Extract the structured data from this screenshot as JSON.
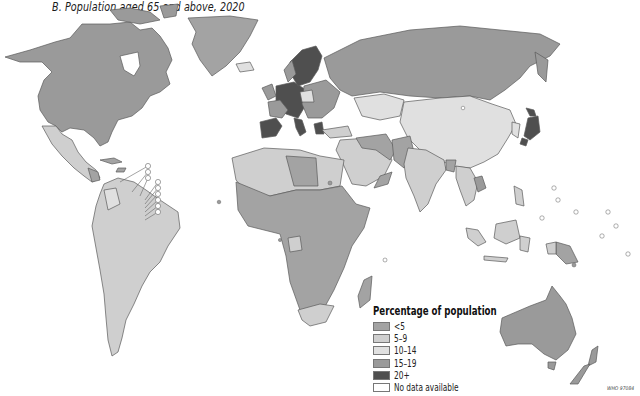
{
  "title": "B.  Population aged 65 and above, 2020",
  "legend": {
    "title": "Percentage of population",
    "items": [
      {
        "label": "<5",
        "color": "#a3a3a3"
      },
      {
        "label": "5–9",
        "color": "#cfcfcf"
      },
      {
        "label": "10–14",
        "color": "#e0e0e0"
      },
      {
        "label": "15–19",
        "color": "#9a9a9a"
      },
      {
        "label": "20+",
        "color": "#4f4f4f"
      },
      {
        "label": "No data available",
        "color": "#ffffff"
      }
    ]
  },
  "credit": "WHO 97084",
  "colors": {
    "lt5": "#a3a3a3",
    "r5_9": "#cfcfcf",
    "r10_14": "#e0e0e0",
    "r15_19": "#9a9a9a",
    "r20plus": "#4f4f4f",
    "nodata": "#ffffff",
    "border": "#5a5a5a"
  },
  "map_regions": [
    {
      "name": "North America (USA/Canada)",
      "category": "15–19"
    },
    {
      "name": "Greenland",
      "category": "<5"
    },
    {
      "name": "Mexico / Central America",
      "category": "5–9"
    },
    {
      "name": "South America",
      "category": "5–9"
    },
    {
      "name": "Northern/Western Europe (Sweden, Germany, Italy, Spain, Greece)",
      "category": "20+"
    },
    {
      "name": "Eastern Europe",
      "category": "15–19"
    },
    {
      "name": "Russia",
      "category": "15–19"
    },
    {
      "name": "China / Mongolia",
      "category": "10–14"
    },
    {
      "name": "Japan",
      "category": "20+"
    },
    {
      "name": "India / South Asia",
      "category": "5–9"
    },
    {
      "name": "Middle East",
      "category": "<5"
    },
    {
      "name": "North Africa",
      "category": "5–9"
    },
    {
      "name": "Sub-Saharan Africa",
      "category": "<5"
    },
    {
      "name": "South Africa",
      "category": "5–9"
    },
    {
      "name": "Southeast Asia / Indonesia",
      "category": "5–9"
    },
    {
      "name": "Australia",
      "category": "15–19"
    },
    {
      "name": "New Zealand",
      "category": "15–19"
    }
  ]
}
